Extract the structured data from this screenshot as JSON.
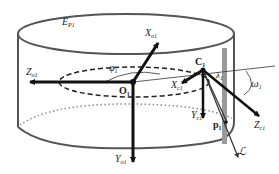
{
  "diagram": {
    "ellipsoid_label": "E",
    "ellipsoid_sub": "P1",
    "labels": {
      "X_o": {
        "main": "X",
        "sub": "o1"
      },
      "Z_o": {
        "main": "Z",
        "sub": "o1"
      },
      "Y_o": {
        "main": "Y",
        "sub": "o1"
      },
      "O": {
        "main": "O",
        "sub": "1"
      },
      "phi": {
        "main": "φ",
        "sub": "1"
      },
      "C": {
        "main": "C",
        "sub": "1"
      },
      "X_c": {
        "main": "X",
        "sub": "c1"
      },
      "Y_c": {
        "main": "Y",
        "sub": "c1"
      },
      "Z_c": {
        "main": "Z",
        "sub": "c1"
      },
      "omega": {
        "main": "ω",
        "sub": "1"
      },
      "p": {
        "main": "p",
        "sub": "1"
      },
      "lambda": {
        "main": "λ",
        "sub": "1"
      },
      "L": {
        "main": "ℒ"
      }
    },
    "colors": {
      "outline": "#555555",
      "axis": "#111111",
      "band": "#9a9a9a",
      "dotted": "#8a8a8a"
    }
  }
}
